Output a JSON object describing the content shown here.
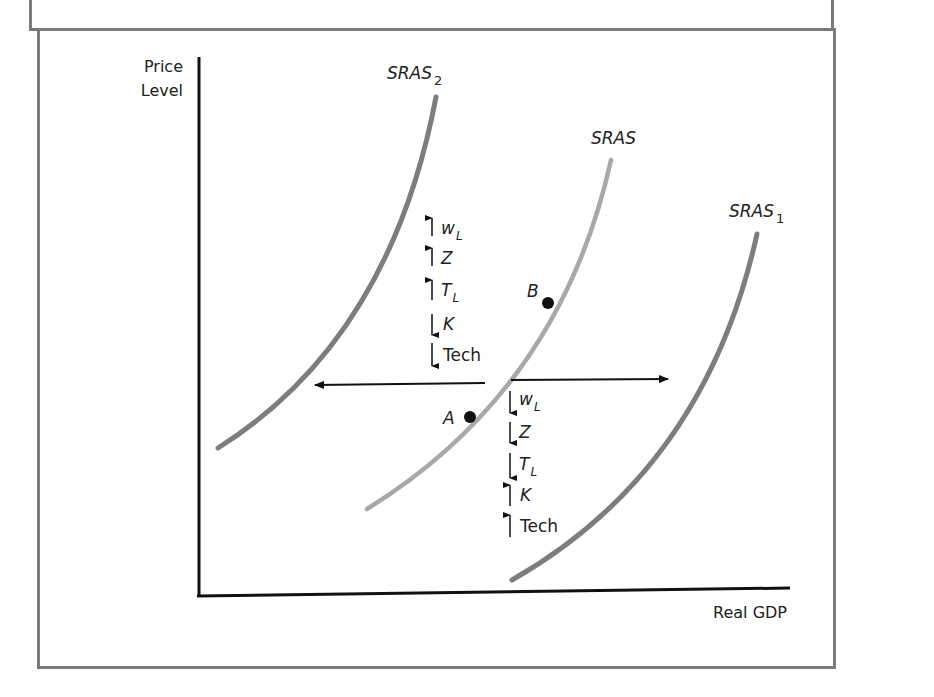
{
  "figure": {
    "y_axis_label_line1": "Price",
    "y_axis_label_line2": "Level",
    "x_axis_label": "Real GDP"
  },
  "curves": {
    "sras2": {
      "name": "SRAS",
      "subscript": "2",
      "color": "#7d7d7d"
    },
    "sras": {
      "name": "SRAS",
      "subscript": "",
      "color": "#a8a8a8"
    },
    "sras1": {
      "name": "SRAS",
      "subscript": "1",
      "color": "#7d7d7d"
    }
  },
  "points": {
    "a": {
      "label": "A"
    },
    "b": {
      "label": "B"
    }
  },
  "left_shift_factors": [
    {
      "arrow": "up",
      "symbol": "W",
      "subscript": "L"
    },
    {
      "arrow": "up",
      "symbol": "Z",
      "subscript": ""
    },
    {
      "arrow": "up",
      "symbol": "T",
      "subscript": "L"
    },
    {
      "arrow": "down",
      "symbol": "K",
      "subscript": ""
    },
    {
      "arrow": "down",
      "symbol": "Tech",
      "subscript": ""
    }
  ],
  "right_shift_factors": [
    {
      "arrow": "down",
      "symbol": "W",
      "subscript": "L"
    },
    {
      "arrow": "down",
      "symbol": "Z",
      "subscript": ""
    },
    {
      "arrow": "down",
      "symbol": "T",
      "subscript": "L"
    },
    {
      "arrow": "up",
      "symbol": "K",
      "subscript": ""
    },
    {
      "arrow": "up",
      "symbol": "Tech",
      "subscript": ""
    }
  ],
  "labels": {
    "l0": "w",
    "l0s": "L",
    "l1": "Z",
    "l2": "T",
    "l2s": "L",
    "l3": "K",
    "l4": "Tech",
    "r0": "w",
    "r0s": "L",
    "r1": "Z",
    "r2": "T",
    "r2s": "L",
    "r3": "K",
    "r4": "Tech"
  }
}
